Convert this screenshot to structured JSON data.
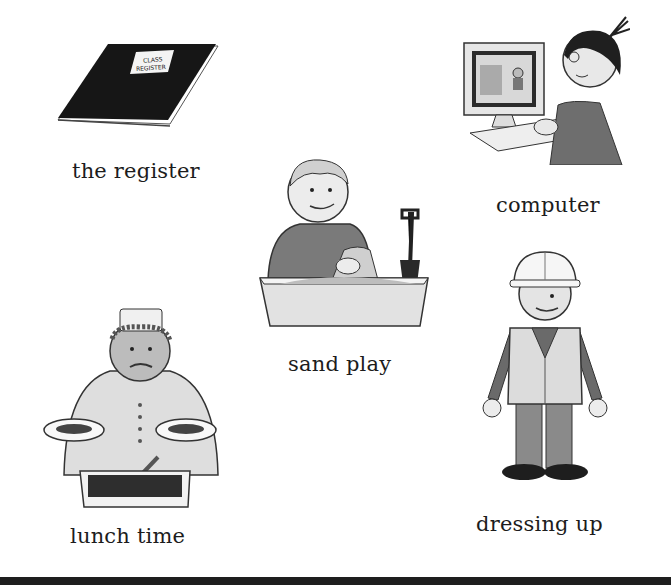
{
  "page": {
    "items": [
      {
        "id": "register",
        "label": "the register",
        "icon": "class-register-book",
        "sign_text": [
          "CLASS",
          "REGISTER"
        ]
      },
      {
        "id": "computer",
        "label": "computer",
        "icon": "child-at-computer"
      },
      {
        "id": "sand",
        "label": "sand play",
        "icon": "child-in-sandpit"
      },
      {
        "id": "lunch",
        "label": "lunch time",
        "icon": "dinner-lady-serving"
      },
      {
        "id": "dress",
        "label": "dressing up",
        "icon": "child-in-hard-hat"
      }
    ]
  },
  "colors": {
    "background": "#ffffff",
    "ink": "#1c1c1c",
    "bar": "#1e1e1e"
  }
}
